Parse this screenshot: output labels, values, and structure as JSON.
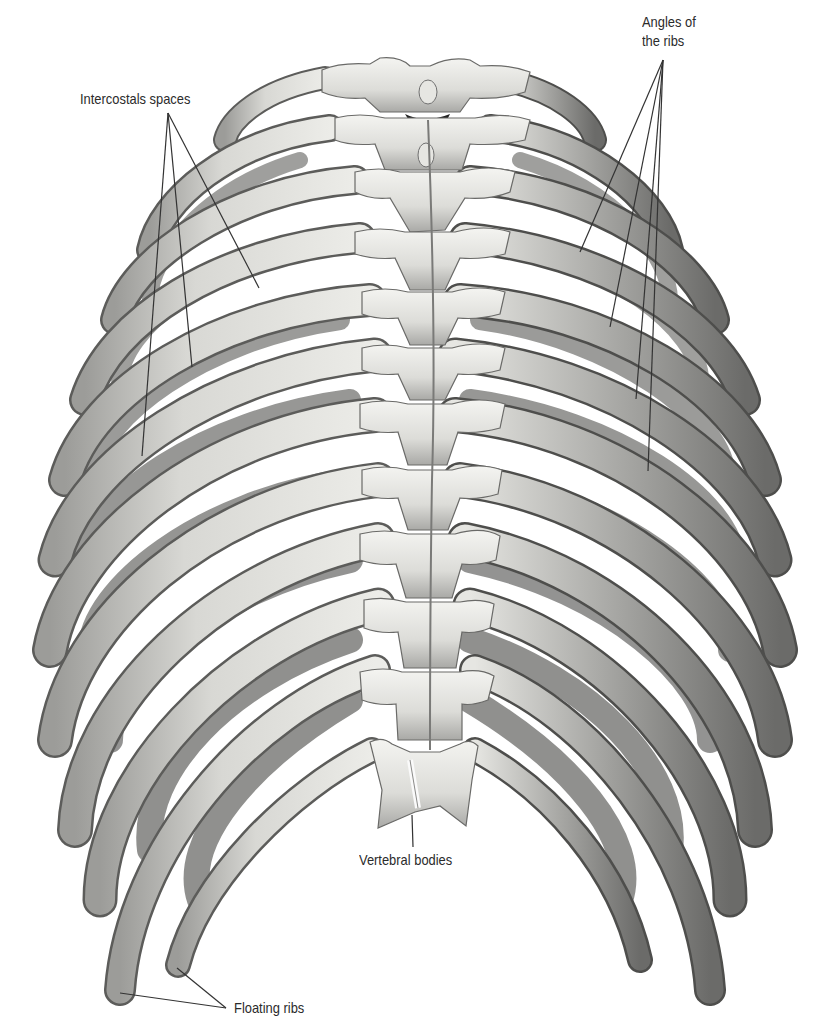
{
  "figure": {
    "colors": {
      "background": "#ffffff",
      "bone_light": "#eeeeea",
      "bone_mid": "#cfcfcb",
      "bone_shadow": "#8e8e8c",
      "rib_inner_dark": "#6e6e6c",
      "leader_line": "#333333",
      "label_text": "#2b2b2b"
    }
  },
  "labels": {
    "intercostal_spaces": "Intercostals spaces",
    "angles_of_ribs_line1": "Angles of",
    "angles_of_ribs_line2": "the ribs",
    "vertebral_bodies": "Vertebral bodies",
    "floating_ribs": "Floating ribs"
  },
  "leaders": {
    "intercostal_spaces": {
      "origin": [
        168,
        113
      ],
      "targets": [
        [
          259,
          288
        ],
        [
          192,
          367
        ],
        [
          142,
          456
        ]
      ]
    },
    "angles_of_ribs": {
      "origin": [
        663,
        60
      ],
      "targets": [
        [
          580,
          252
        ],
        [
          610,
          327
        ],
        [
          636,
          399
        ],
        [
          648,
          471
        ]
      ]
    },
    "vertebral_bodies": {
      "origin": [
        413,
        847
      ],
      "targets": [
        [
          412,
          815
        ]
      ]
    },
    "floating_ribs": {
      "origin": [
        226,
        1008
      ],
      "targets": [
        [
          120,
          993
        ],
        [
          177,
          968
        ]
      ]
    }
  }
}
